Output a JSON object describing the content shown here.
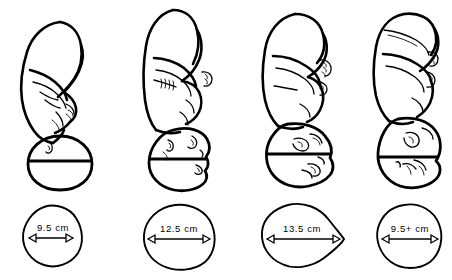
{
  "figure": {
    "panel_count": 4,
    "line_color": "#000000",
    "background_color": "#ffffff"
  },
  "panels": [
    {
      "index": 1,
      "attitude": "complete flexion",
      "presentation": "vertex",
      "diameter_name": "suboccipitobregmatic",
      "measurement": "9.5 cm",
      "cross_section_shape": "round",
      "center_x": 72
    },
    {
      "index": 2,
      "attitude": "moderate flexion (military)",
      "presentation": "sinciput",
      "diameter_name": "occipitofrontal",
      "measurement": "12.5 cm",
      "cross_section_shape": "wide-oval",
      "center_x": 183
    },
    {
      "index": 3,
      "attitude": "partial extension",
      "presentation": "brow",
      "diameter_name": "occipitomental",
      "measurement": "13.5 cm",
      "cross_section_shape": "teardrop",
      "center_x": 302
    },
    {
      "index": 4,
      "attitude": "complete extension",
      "presentation": "face",
      "diameter_name": "submentobregmatic",
      "measurement": "9.5+ cm",
      "cross_section_shape": "round",
      "center_x": 412
    }
  ]
}
